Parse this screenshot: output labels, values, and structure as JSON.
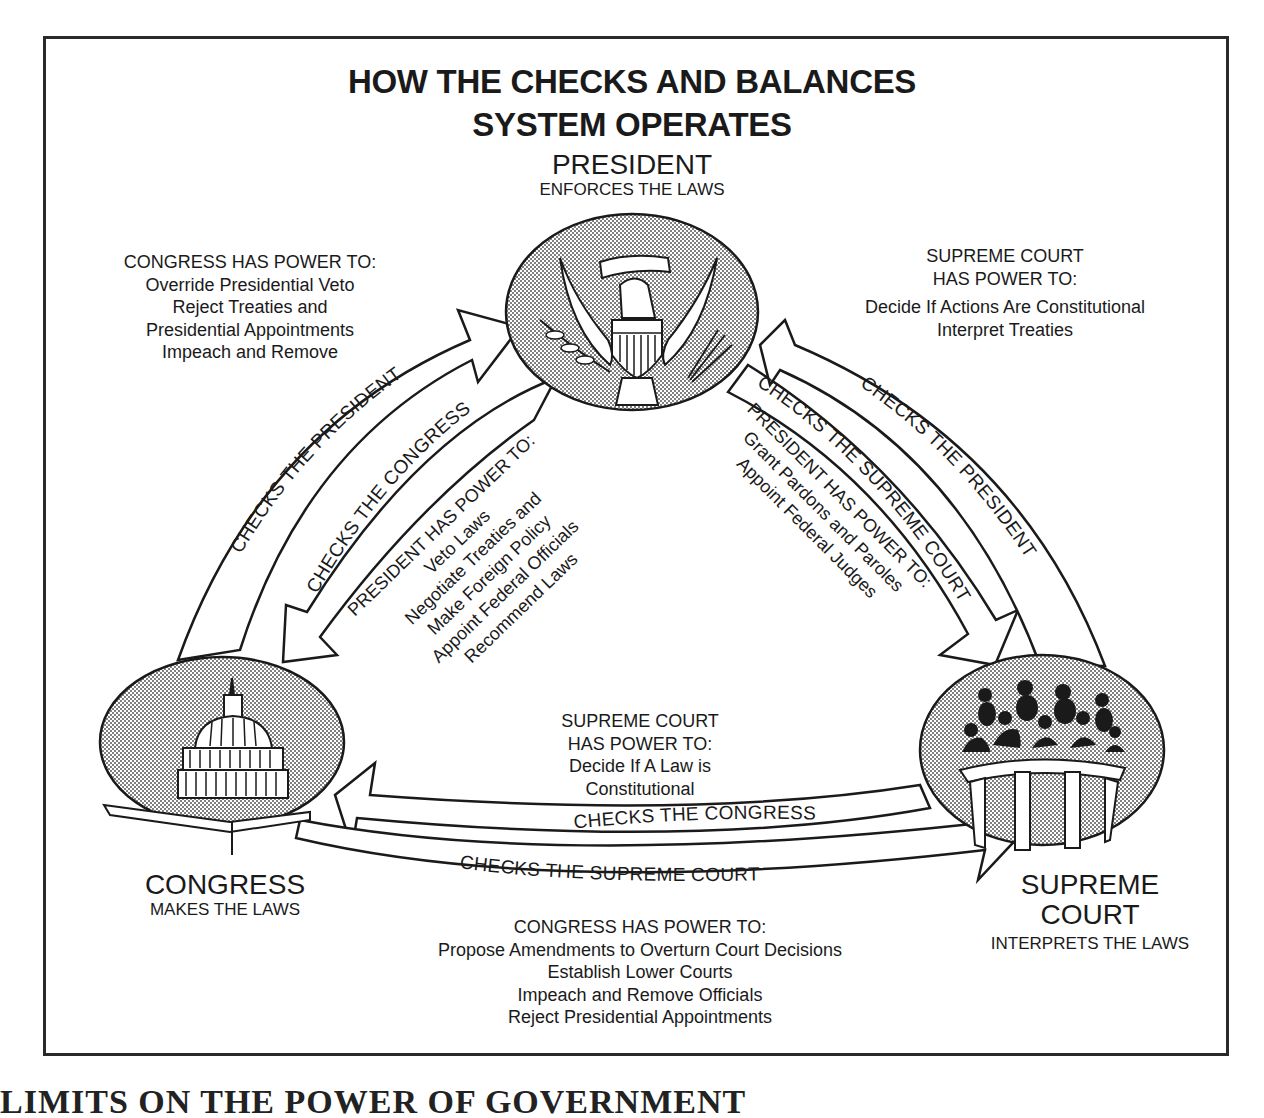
{
  "title": {
    "line1": "HOW THE CHECKS AND BALANCES",
    "line2": "SYSTEM OPERATES"
  },
  "branches": {
    "president": {
      "name": "PRESIDENT",
      "role": "ENFORCES THE LAWS",
      "icon": "presidential-eagle-seal"
    },
    "congress": {
      "name": "CONGRESS",
      "role": "MAKES THE LAWS",
      "icon": "capitol-dome"
    },
    "supreme_court": {
      "name_line1": "SUPREME",
      "name_line2": "COURT",
      "role": "INTERPRETS THE LAWS",
      "icon": "justices-bench"
    }
  },
  "power_blocks": {
    "congress_over_president": {
      "heading": "CONGRESS HAS POWER TO:",
      "items": [
        "Override Presidential Veto",
        "Reject Treaties and",
        "Presidential Appointments",
        "Impeach and Remove"
      ]
    },
    "court_over_president": {
      "heading_line1": "SUPREME COURT",
      "heading_line2": "HAS POWER TO:",
      "items": [
        "Decide If Actions Are Constitutional",
        "Interpret Treaties"
      ]
    },
    "president_over_congress": {
      "heading": "PRESIDENT HAS POWER TO:",
      "items": [
        "Veto Laws",
        "Negotiate Treaties and",
        "Make Foreign Policy",
        "Appoint Federal Officials",
        "Recommend Laws"
      ]
    },
    "president_over_court": {
      "heading": "PRESIDENT HAS POWER TO:",
      "items": [
        "Grant Pardons and Paroles",
        "Appoint Federal Judges"
      ]
    },
    "court_over_congress": {
      "heading_line1": "SUPREME COURT",
      "heading_line2": "HAS POWER TO:",
      "items": [
        "Decide If A Law is",
        "Constitutional"
      ]
    },
    "congress_over_court": {
      "heading": "CONGRESS HAS POWER TO:",
      "items": [
        "Propose Amendments to Overturn Court Decisions",
        "Establish Lower Courts",
        "Impeach and Remove Officials",
        "Reject Presidential Appointments"
      ]
    }
  },
  "arrows": {
    "congress_to_president": "CHECKS THE PRESIDENT",
    "president_to_congress": "CHECKS THE CONGRESS",
    "president_to_court": "CHECKS THE SUPREME COURT",
    "court_to_president": "CHECKS THE PRESIDENT",
    "court_to_congress": "CHECKS THE CONGRESS",
    "congress_to_court": "CHECKS THE SUPREME COURT"
  },
  "footer_cut_text": "LIMITS ON THE POWER OF GOVERNMENT",
  "colors": {
    "ink": "#1a1a1a",
    "stipple": "#8a8a8a",
    "paper": "#ffffff"
  }
}
